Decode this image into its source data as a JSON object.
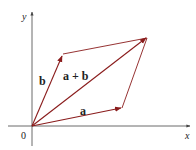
{
  "diagram": {
    "axes": {
      "x_label": "x",
      "y_label": "y",
      "origin_label": "0"
    },
    "vectors": [
      {
        "label": "a",
        "from": [
          0,
          0
        ],
        "to": "a"
      },
      {
        "label": "b",
        "from": [
          0,
          0
        ],
        "to": "b"
      },
      {
        "label": "a + b",
        "from": [
          0,
          0
        ],
        "to": "a+b"
      }
    ],
    "colors": {
      "vector": "#8a1c1c",
      "axis": "#444444",
      "text": "#222222"
    }
  }
}
